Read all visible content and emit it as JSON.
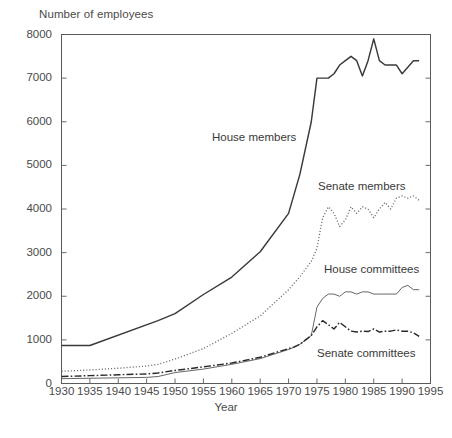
{
  "chart_data": {
    "type": "line",
    "title": "",
    "ylabel": "Number of employees",
    "xlabel": "Year",
    "xlim": [
      1930,
      1995
    ],
    "ylim": [
      0,
      8000
    ],
    "ytick_labels": [
      "0",
      "1000",
      "2000",
      "3000",
      "4000",
      "5000",
      "6000",
      "7000",
      "8000"
    ],
    "ytick_values": [
      0,
      1000,
      2000,
      3000,
      4000,
      5000,
      6000,
      7000,
      8000
    ],
    "xtick_labels": [
      "1930",
      "1935",
      "1940",
      "1945",
      "1950",
      "1955",
      "1960",
      "1965",
      "1970",
      "1975",
      "1980",
      "1985",
      "1990",
      "1995"
    ],
    "xtick_values": [
      1930,
      1935,
      1940,
      1945,
      1950,
      1955,
      1960,
      1965,
      1970,
      1975,
      1980,
      1985,
      1990,
      1995
    ],
    "grid": false,
    "legend_position": "inline-annotations",
    "series": [
      {
        "name": "House members",
        "style": "solid",
        "color": "#3a3a3a",
        "width": 1.45,
        "x": [
          1930,
          1935,
          1947,
          1950,
          1955,
          1960,
          1965,
          1970,
          1972,
          1974,
          1975,
          1976,
          1977,
          1978,
          1979,
          1980,
          1981,
          1982,
          1983,
          1984,
          1985,
          1986,
          1987,
          1988,
          1989,
          1990,
          1991,
          1992,
          1993
        ],
        "values": [
          870,
          870,
          1440,
          1600,
          2040,
          2440,
          3020,
          3900,
          4800,
          6000,
          7000,
          7000,
          7000,
          7100,
          7300,
          7400,
          7500,
          7400,
          7050,
          7400,
          7900,
          7400,
          7300,
          7300,
          7300,
          7100,
          7250,
          7400,
          7400
        ]
      },
      {
        "name": "Senate members",
        "style": "dotted",
        "color": "#6e6e6e",
        "width": 1.35,
        "x": [
          1930,
          1935,
          1940,
          1945,
          1947,
          1950,
          1955,
          1960,
          1965,
          1970,
          1972,
          1974,
          1975,
          1976,
          1977,
          1978,
          1979,
          1980,
          1981,
          1982,
          1983,
          1984,
          1985,
          1986,
          1987,
          1988,
          1989,
          1990,
          1991,
          1992,
          1993
        ],
        "values": [
          280,
          310,
          350,
          400,
          440,
          560,
          800,
          1150,
          1550,
          2150,
          2450,
          2800,
          3100,
          3800,
          4050,
          3900,
          3600,
          3750,
          4050,
          3900,
          4050,
          4000,
          3800,
          4000,
          4150,
          4000,
          4250,
          4300,
          4250,
          4300,
          4200
        ]
      },
      {
        "name": "House committees",
        "style": "solid",
        "color": "#555555",
        "width": 0.9,
        "x": [
          1930,
          1935,
          1940,
          1945,
          1947,
          1950,
          1955,
          1960,
          1965,
          1970,
          1971,
          1972,
          1973,
          1974,
          1975,
          1976,
          1977,
          1978,
          1979,
          1980,
          1981,
          1982,
          1983,
          1984,
          1985,
          1986,
          1987,
          1988,
          1989,
          1990,
          1991,
          1992,
          1993
        ],
        "values": [
          110,
          120,
          130,
          140,
          160,
          250,
          330,
          440,
          570,
          780,
          830,
          900,
          1000,
          1100,
          1750,
          1950,
          2050,
          2050,
          2000,
          2100,
          2100,
          2050,
          2100,
          2100,
          2050,
          2050,
          2050,
          2050,
          2050,
          2200,
          2250,
          2150,
          2150
        ]
      },
      {
        "name": "Senate committees",
        "style": "dashdot",
        "color": "#2a2a2a",
        "width": 1.45,
        "x": [
          1930,
          1935,
          1940,
          1945,
          1947,
          1950,
          1955,
          1960,
          1965,
          1970,
          1971,
          1972,
          1973,
          1974,
          1975,
          1976,
          1977,
          1978,
          1979,
          1980,
          1981,
          1982,
          1983,
          1984,
          1985,
          1986,
          1987,
          1988,
          1989,
          1990,
          1991,
          1992,
          1993
        ],
        "values": [
          160,
          180,
          200,
          220,
          240,
          300,
          380,
          470,
          600,
          800,
          840,
          900,
          1000,
          1100,
          1300,
          1440,
          1350,
          1250,
          1400,
          1300,
          1200,
          1180,
          1200,
          1190,
          1250,
          1180,
          1200,
          1200,
          1230,
          1200,
          1200,
          1160,
          1080
        ]
      }
    ],
    "annotations": [
      {
        "text": "House members",
        "x_px": 212,
        "y_px": 131
      },
      {
        "text": "Senate members",
        "x_px": 318,
        "y_px": 180
      },
      {
        "text": "House committees",
        "x_px": 324,
        "y_px": 263
      },
      {
        "text": "Senate committees",
        "x_px": 317,
        "y_px": 347
      }
    ]
  },
  "axes": {
    "ylabel": "Number of employees",
    "xlabel": "Year"
  }
}
